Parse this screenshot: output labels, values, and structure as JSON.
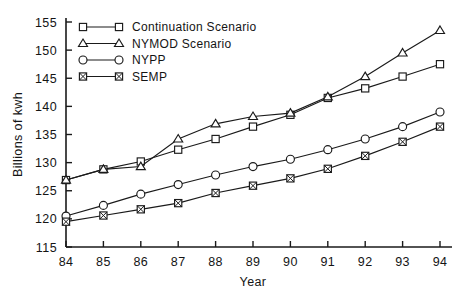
{
  "chart_data": {
    "type": "line",
    "title": "",
    "xlabel": "Year",
    "ylabel": "Billions of kwh",
    "x": [
      84,
      85,
      86,
      87,
      88,
      89,
      90,
      91,
      92,
      93,
      94
    ],
    "categories": [
      "84",
      "85",
      "86",
      "87",
      "88",
      "89",
      "90",
      "91",
      "92",
      "93",
      "94"
    ],
    "xlim": [
      84,
      94
    ],
    "ylim": [
      115,
      155
    ],
    "yticks": [
      115,
      120,
      125,
      130,
      135,
      140,
      145,
      150,
      155
    ],
    "xticks": [
      84,
      85,
      86,
      87,
      88,
      89,
      90,
      91,
      92,
      93,
      94
    ],
    "grid": false,
    "legend_position": "top-left-inside",
    "series": [
      {
        "name": "Continuation Scenario",
        "marker": "square",
        "values": [
          126.9,
          128.8,
          130.2,
          132.3,
          134.2,
          136.4,
          138.5,
          141.5,
          143.2,
          145.3,
          147.5
        ]
      },
      {
        "name": "NYMOD Scenario",
        "marker": "triangle",
        "values": [
          126.9,
          128.8,
          129.3,
          134.2,
          136.9,
          138.2,
          138.8,
          141.7,
          145.3,
          149.5,
          153.5
        ]
      },
      {
        "name": "NYPP",
        "marker": "circle",
        "values": [
          120.5,
          122.4,
          124.4,
          126.1,
          127.8,
          129.3,
          130.6,
          132.3,
          134.2,
          136.4,
          139.0
        ]
      },
      {
        "name": "SEMP",
        "marker": "crossed-square",
        "values": [
          119.5,
          120.6,
          121.7,
          122.8,
          124.6,
          125.9,
          127.2,
          128.9,
          131.2,
          133.7,
          136.4
        ]
      }
    ]
  },
  "legend": {
    "entries": [
      {
        "label": "Continuation Scenario",
        "marker": "square"
      },
      {
        "label": "NYMOD Scenario",
        "marker": "triangle"
      },
      {
        "label": "NYPP",
        "marker": "circle"
      },
      {
        "label": "SEMP",
        "marker": "crossed-square"
      }
    ]
  },
  "colors": {
    "ink": "#1a1a1a",
    "background": "#ffffff"
  }
}
